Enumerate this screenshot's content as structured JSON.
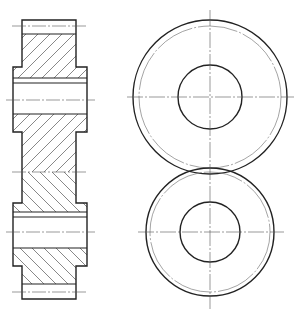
{
  "drawing": {
    "title": "Spur gear pair - section and end views",
    "colors": {
      "line": "#222222",
      "thin": "#555555",
      "background": "#ffffff"
    },
    "section_view": {
      "upper_gear": {
        "rim": {
          "x": 22,
          "y1": 20,
          "x2": 76,
          "y2": 67
        },
        "rim_addendum_line_y": 34,
        "pitch_centerline_y": 26,
        "hub": {
          "x": 13,
          "x2": 87,
          "y1": 67,
          "y2": 132
        },
        "bore_top_lines_y": [
          78,
          83
        ],
        "bore_bottom_line_y": 114,
        "axis_centerline_y": 100,
        "hatch_direction": "forward"
      },
      "lower_gear": {
        "rim_x": 22,
        "rim_x2": 76,
        "hub": {
          "x": 13,
          "x2": 87,
          "y1": 203,
          "y2": 266
        },
        "bore_top_lines_y": [
          212,
          217
        ],
        "bore_bottom_line_y": 248,
        "axis_centerline_y": 232,
        "rim_addendum_line_y": 284,
        "pitch_centerline_y": 292,
        "bottom_y": 299,
        "hatch_direction": "backward"
      },
      "mesh_centerline_y": 172
    },
    "end_view": {
      "upper_gear": {
        "cx": 210,
        "cy": 97,
        "outer_r": 77,
        "pitch_r": 71,
        "bore_r": 32
      },
      "lower_gear": {
        "cx": 210,
        "cy": 232,
        "outer_r": 64,
        "pitch_r": 60,
        "bore_r": 30
      }
    }
  }
}
